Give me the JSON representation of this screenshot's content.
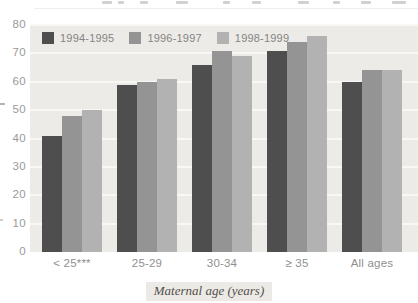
{
  "chart_data": {
    "type": "bar",
    "title": "",
    "xlabel": "Maternal age (years)",
    "ylabel": "",
    "ylim": [
      0,
      80
    ],
    "yticks": [
      0,
      10,
      20,
      30,
      40,
      50,
      60,
      70,
      80
    ],
    "grid": true,
    "legend_position": "top-left-inside-plot",
    "categories": [
      "< 25***",
      "25-29",
      "30-34",
      "≥ 35",
      "All ages"
    ],
    "series": [
      {
        "name": "1994-1995",
        "color": "#4e4e4e",
        "values": [
          41,
          59,
          66,
          71,
          60
        ]
      },
      {
        "name": "1996-1997",
        "color": "#949494",
        "values": [
          48,
          60,
          71,
          74,
          64
        ]
      },
      {
        "name": "1998-1999",
        "color": "#b2b2b2",
        "values": [
          50,
          61,
          69,
          76,
          64
        ]
      }
    ],
    "plot_background": "#edebe8",
    "gridline_color": "#f9f8f5"
  }
}
